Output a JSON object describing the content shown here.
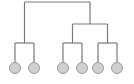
{
  "diagram": {
    "type": "tree",
    "style": {
      "edge_color": "#7a7a7a",
      "leaf_fill": "#cfcfcf",
      "leaf_stroke": "#9a9a9a",
      "background": "#ffffff"
    },
    "root": {
      "id": "root",
      "children": [
        {
          "id": "left-pair",
          "children": [
            {
              "id": "leaf-1"
            },
            {
              "id": "leaf-2"
            }
          ]
        },
        {
          "id": "right-subtree",
          "children": [
            {
              "id": "right-left-pair",
              "children": [
                {
                  "id": "leaf-3"
                },
                {
                  "id": "leaf-4"
                }
              ]
            },
            {
              "id": "right-right-pair",
              "children": [
                {
                  "id": "leaf-5"
                },
                {
                  "id": "leaf-6"
                }
              ]
            }
          ]
        }
      ]
    },
    "leaf_count": 6
  }
}
